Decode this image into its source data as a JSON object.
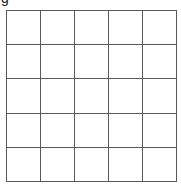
{
  "header": {
    "cutoff_label": "g"
  },
  "grid": {
    "rows": 5,
    "columns": 5,
    "line_color": "#5a5a5a",
    "background_color": "#ffffff",
    "cells": [
      [
        "",
        "",
        "",
        "",
        ""
      ],
      [
        "",
        "",
        "",
        "",
        ""
      ],
      [
        "",
        "",
        "",
        "",
        ""
      ],
      [
        "",
        "",
        "",
        "",
        ""
      ],
      [
        "",
        "",
        "",
        "",
        ""
      ]
    ]
  }
}
